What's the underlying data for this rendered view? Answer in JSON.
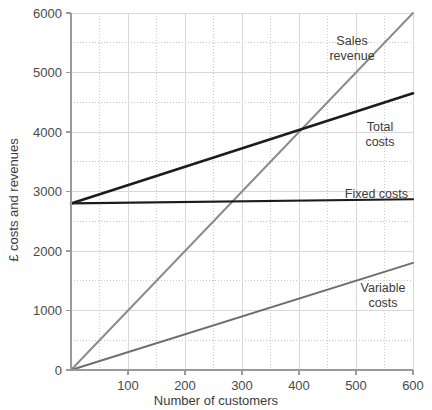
{
  "chart_data": {
    "type": "line",
    "title": "",
    "xlabel": "Number of customers",
    "ylabel": "£ costs and revenues",
    "xlim": [
      0,
      600
    ],
    "ylim": [
      0,
      6000
    ],
    "x_major_ticks": [
      0,
      100,
      200,
      300,
      400,
      500,
      600
    ],
    "x_major_tick_labels": [
      "0",
      "100",
      "200",
      "300",
      "400",
      "500",
      "600"
    ],
    "x_minor_step": 50,
    "y_major_ticks": [
      0,
      1000,
      2000,
      3000,
      4000,
      5000,
      6000
    ],
    "y_major_tick_labels": [
      "0",
      "1000",
      "2000",
      "3000",
      "4000",
      "5000",
      "6000"
    ],
    "y_minor_step": 500,
    "grid": "major solid, minor dotted",
    "legend_position": "inline labels next to each line",
    "x": [
      0,
      600
    ],
    "series": [
      {
        "name": "Sales revenue",
        "label": "Sales\nrevenue",
        "label_line1": "Sales",
        "label_line2": "revenue",
        "color": "#8c8c8c",
        "width": 2,
        "values": [
          0,
          6000
        ]
      },
      {
        "name": "Total costs",
        "label": "Total\ncosts",
        "label_line1": "Total",
        "label_line2": "costs",
        "color": "#1c1c1c",
        "width": 2.6,
        "values": [
          2800,
          4650
        ]
      },
      {
        "name": "Fixed costs",
        "label": "Fixed costs",
        "label_line1": "Fixed costs",
        "label_line2": "",
        "color": "#1c1c1c",
        "width": 2.2,
        "values": [
          2800,
          2870
        ]
      },
      {
        "name": "Variable costs",
        "label": "Variable\ncosts",
        "label_line1": "Variable",
        "label_line2": "costs",
        "color": "#6e6e6e",
        "width": 2,
        "values": [
          0,
          1800
        ]
      }
    ],
    "annotations": [
      {
        "name": "break-even-point",
        "x": 400,
        "y": 4000,
        "text": ""
      }
    ],
    "colors": {
      "axis": "#9a9a9a",
      "grid_major": "#d8d8d8",
      "grid_minor": "#c9c9c9",
      "text": "#3b3b3b",
      "background": "#ffffff"
    }
  }
}
